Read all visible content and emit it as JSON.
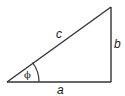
{
  "diagram": {
    "type": "right-triangle",
    "labels": {
      "hypotenuse": "c",
      "opposite": "b",
      "adjacent": "a",
      "angle": "ϕ"
    },
    "stroke_color": "#333333"
  }
}
